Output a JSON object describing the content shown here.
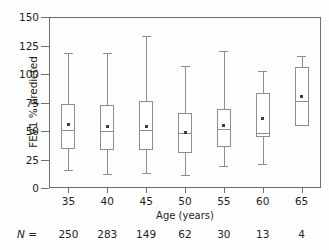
{
  "chart_data": {
    "type": "box",
    "title": "",
    "xlabel": "Age (years)",
    "ylabel": "FEV1 % predicted",
    "xtick_labels": [
      "35",
      "40",
      "45",
      "50",
      "55",
      "60",
      "65"
    ],
    "ytick_labels": [
      "0",
      "25",
      "50",
      "75",
      "100",
      "125",
      "150"
    ],
    "ylim": [
      0,
      150
    ],
    "grid": false,
    "legend": "none",
    "n_row_label": "N =",
    "categories": [
      35,
      40,
      45,
      50,
      55,
      60,
      65
    ],
    "n_values": [
      "250",
      "283",
      "149",
      "62",
      "30",
      "13",
      "4"
    ],
    "boxes": [
      {
        "category": "35",
        "whisker_low": 16,
        "q1": 34,
        "median": 51,
        "mean": 56,
        "q3": 74,
        "whisker_high": 118,
        "n": "250"
      },
      {
        "category": "40",
        "whisker_low": 12,
        "q1": 33,
        "median": 50,
        "mean": 54,
        "q3": 73,
        "whisker_high": 118,
        "n": "283"
      },
      {
        "category": "45",
        "whisker_low": 13,
        "q1": 33,
        "median": 51,
        "mean": 54,
        "q3": 76,
        "whisker_high": 133,
        "n": "149"
      },
      {
        "category": "50",
        "whisker_low": 11,
        "q1": 31,
        "median": 48,
        "mean": 49,
        "q3": 66,
        "whisker_high": 107,
        "n": "62"
      },
      {
        "category": "55",
        "whisker_low": 19,
        "q1": 36,
        "median": 52,
        "mean": 55,
        "q3": 69,
        "whisker_high": 120,
        "n": "30"
      },
      {
        "category": "60",
        "whisker_low": 21,
        "q1": 45,
        "median": 48,
        "mean": 61,
        "q3": 83,
        "whisker_high": 103,
        "n": "13"
      },
      {
        "category": "65",
        "whisker_low": 54,
        "q1": 54,
        "median": 76,
        "mean": 80,
        "q3": 106,
        "whisker_high": 116,
        "n": "4"
      }
    ]
  },
  "axes": {
    "y_title": "FEV1 % predicted",
    "x_title": "Age (years)"
  },
  "colors": {
    "ink": "#231f20",
    "line": "#6d6e70",
    "box_stroke": "#8d8e90",
    "mean_marker": "#3c3c3c",
    "background": "#fdfdfd"
  }
}
